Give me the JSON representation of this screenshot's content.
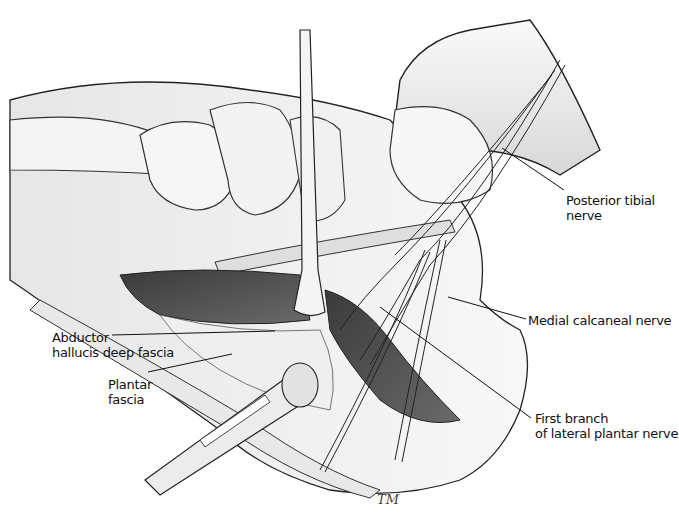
{
  "figure": {
    "type": "anatomical illustration",
    "labels": [
      {
        "id": "posterior-tibial-nerve",
        "line1": "Posterior tibial",
        "line2": "nerve"
      },
      {
        "id": "medial-calcaneal-nerve",
        "line1": "Medial calcaneal nerve",
        "line2": ""
      },
      {
        "id": "abductor-hallucis-deep-fascia",
        "line1": "Abductor",
        "line2": "hallucis deep fascia"
      },
      {
        "id": "plantar-fascia",
        "line1": "Plantar",
        "line2": "fascia"
      },
      {
        "id": "first-branch-lateral-plantar-nerve",
        "line1": "First branch",
        "line2": "of lateral plantar nerve"
      }
    ],
    "signature": "TM",
    "colors": {
      "ink": "#1a1a1a",
      "muscle": "#4a4a4a",
      "bone": "#f2f2f2",
      "shade": "#bdbdbd",
      "background": "#ffffff"
    }
  }
}
